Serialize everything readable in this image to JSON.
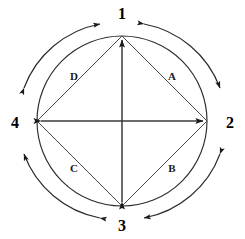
{
  "diagram": {
    "type": "circular-cycle-diagram",
    "stroke_color": "#1a1a1a",
    "background_color": "#ffffff",
    "center": {
      "x": 122,
      "y": 121
    },
    "inner_circle_radius": 85,
    "outer_arc_radius": 101,
    "nodes": [
      {
        "id": "node-1",
        "label": "1",
        "position": "top",
        "x": 122,
        "y": 14,
        "vertex_x": 122,
        "vertex_y": 36
      },
      {
        "id": "node-2",
        "label": "2",
        "position": "right",
        "x": 230,
        "y": 123,
        "vertex_x": 207,
        "vertex_y": 121
      },
      {
        "id": "node-3",
        "label": "3",
        "position": "bottom",
        "x": 122,
        "y": 226,
        "vertex_x": 122,
        "vertex_y": 206
      },
      {
        "id": "node-4",
        "label": "4",
        "position": "left",
        "x": 15,
        "y": 123,
        "vertex_x": 37,
        "vertex_y": 121
      }
    ],
    "side_labels": [
      {
        "id": "side-a",
        "label": "A",
        "quadrant": "upper-right",
        "x": 172,
        "y": 76
      },
      {
        "id": "side-b",
        "label": "B",
        "quadrant": "lower-right",
        "x": 172,
        "y": 168
      },
      {
        "id": "side-c",
        "label": "C",
        "quadrant": "lower-left",
        "x": 74,
        "y": 168
      },
      {
        "id": "side-d",
        "label": "D",
        "quadrant": "upper-left",
        "x": 74,
        "y": 76
      }
    ],
    "diamond_edges": [
      {
        "id": "edge-4-1",
        "from": "4",
        "to": "1",
        "label": "D"
      },
      {
        "id": "edge-1-2",
        "from": "1",
        "to": "2",
        "label": "A"
      },
      {
        "id": "edge-2-3",
        "from": "2",
        "to": "3",
        "label": "B"
      },
      {
        "id": "edge-3-4",
        "from": "3",
        "to": "4",
        "label": "C"
      }
    ],
    "diagonals": [
      {
        "id": "diagonal-vertical",
        "from": "3",
        "to": "1",
        "arrowheads": "both"
      },
      {
        "id": "diagonal-horizontal",
        "from": "4",
        "to": "2",
        "arrowheads": "both"
      }
    ],
    "outer_arcs": [
      {
        "id": "outer-arc-4-1",
        "quadrant": "upper-left",
        "between": [
          "4",
          "1"
        ],
        "arrowheads": "both"
      },
      {
        "id": "outer-arc-1-2",
        "quadrant": "upper-right",
        "between": [
          "1",
          "2"
        ],
        "arrowheads": "both"
      },
      {
        "id": "outer-arc-2-3",
        "quadrant": "lower-right",
        "between": [
          "2",
          "3"
        ],
        "arrowheads": "both"
      },
      {
        "id": "outer-arc-3-4",
        "quadrant": "lower-left",
        "between": [
          "3",
          "4"
        ],
        "arrowheads": "both"
      }
    ]
  }
}
